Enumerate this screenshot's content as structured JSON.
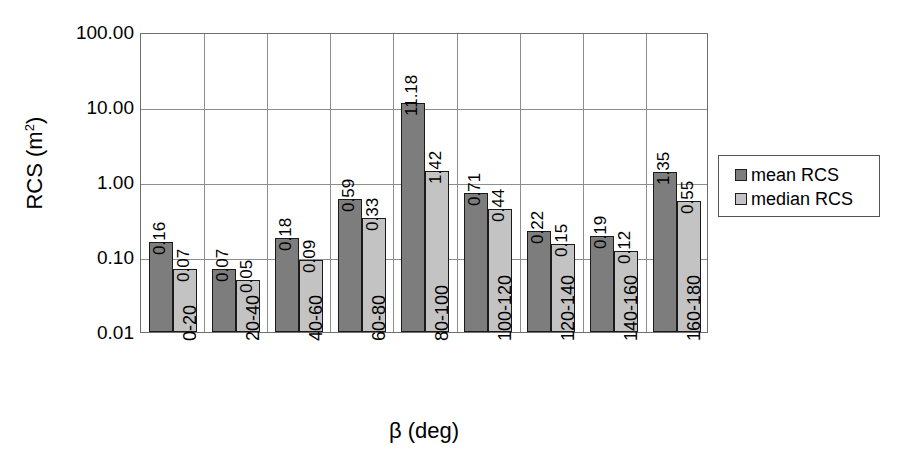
{
  "chart_data": {
    "type": "bar",
    "title": "",
    "xlabel": "β (deg)",
    "ylabel": "RCS (m²)",
    "ylabel_base": "RCS (m",
    "ylabel_sup": "2",
    "ylabel_tail": ")",
    "yscale": "log",
    "ylim": [
      0.01,
      100.0
    ],
    "ytick_labels": [
      "100.00",
      "10.00",
      "1.00",
      "0.10",
      "0.01"
    ],
    "ytick_values": [
      100.0,
      10.0,
      1.0,
      0.1,
      0.01
    ],
    "grid": "horizontal-and-group-separators",
    "legend_position": "right",
    "categories": [
      "0-20",
      "20-40",
      "40-60",
      "60-80",
      "80-100",
      "100-120",
      "120-140",
      "140-160",
      "160-180"
    ],
    "series": [
      {
        "name": "mean RCS",
        "color": "#7d7d7d",
        "values": [
          0.16,
          0.07,
          0.18,
          0.59,
          11.18,
          0.71,
          0.22,
          0.19,
          1.35
        ],
        "labels": [
          "0.16",
          "0.07",
          "0.18",
          "0.59",
          "11.18",
          "0.71",
          "0.22",
          "0.19",
          "1.35"
        ]
      },
      {
        "name": "median RCS",
        "color": "#c3c3c3",
        "values": [
          0.07,
          0.05,
          0.09,
          0.33,
          1.42,
          0.44,
          0.15,
          0.12,
          0.55
        ],
        "labels": [
          "0.07",
          "0.05",
          "0.09",
          "0.33",
          "1.42",
          "0.44",
          "0.15",
          "0.12",
          "0.55"
        ]
      }
    ]
  },
  "legend": {
    "entries": [
      {
        "label": "mean RCS",
        "color": "#7d7d7d"
      },
      {
        "label": "median RCS",
        "color": "#c3c3c3"
      }
    ]
  }
}
